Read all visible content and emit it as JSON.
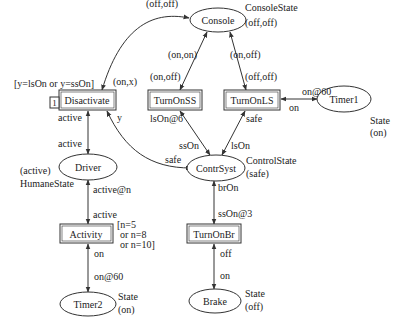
{
  "places": {
    "console": {
      "name": "Console",
      "type_label": "ConsoleState",
      "marking": "(off,off)"
    },
    "timer1": {
      "name": "Timer1",
      "type_label": "State",
      "marking": "(on)"
    },
    "driver": {
      "name": "Driver",
      "type_label": "HumaneState",
      "marking": "(active)"
    },
    "contrsyst": {
      "name": "ContrSyst",
      "type_label": "ControlState",
      "marking": "(safe)"
    },
    "timer2": {
      "name": "Timer2",
      "type_label": "State",
      "marking": "(on)"
    },
    "brake": {
      "name": "Brake",
      "type_label": "State",
      "marking": "(off)"
    }
  },
  "transitions": {
    "disactivate": {
      "name": "Disactivate",
      "guard": "[y=lsOn or y=ssOn]",
      "priority": "1"
    },
    "turnonss": {
      "name": "TurnOnSS"
    },
    "turnonls": {
      "name": "TurnOnLS"
    },
    "activity": {
      "name": "Activity",
      "guard_lines": [
        "[n=5",
        "or n=8",
        "or n=10]"
      ]
    },
    "turnonbr": {
      "name": "TurnOnBr"
    }
  },
  "arcs": {
    "console_disactivate_in": "(off,off)",
    "console_disactivate_out": "(on,x)",
    "console_turnonss_in": "(on,on)",
    "console_turnonss_out": "(on,off)",
    "console_turnonls_in": "(on,off)",
    "console_turnonls_out": "(off,off)",
    "turnonls_timer1_out": "on@60",
    "turnonls_timer1_in": "on",
    "disactivate_driver_in": "active",
    "driver_disactivate_out": "active",
    "contrsyst_disactivate": "y",
    "disactivate_contrsyst": "safe",
    "turnonss_contrsyst_a": "lsOn@6",
    "turnonss_contrsyst_b": "ssOn",
    "turnonls_contrsyst_a": "safe",
    "turnonls_contrsyst_b": "lsOn",
    "driver_activity_a": "active@n",
    "driver_activity_b": "active",
    "activity_timer2_a": "on",
    "activity_timer2_b": "on@60",
    "contrsyst_turnonbr_a": "brOn",
    "contrsyst_turnonbr_b": "ssOn@3",
    "turnonbr_brake_a": "off",
    "turnonbr_brake_b": "on"
  }
}
